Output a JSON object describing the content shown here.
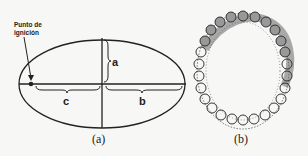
{
  "panel_a": {
    "ignition_label_line1": "Punto de",
    "ignition_label_line2": "ignición",
    "label_a": "a",
    "label_b": "b",
    "label_c": "c",
    "caption": "(a)"
  },
  "panel_b": {
    "caption": "(b)"
  },
  "colors": {
    "stroke": "#222222",
    "burned_fill": "#a8a8a8",
    "background": "#f7f7f5"
  }
}
